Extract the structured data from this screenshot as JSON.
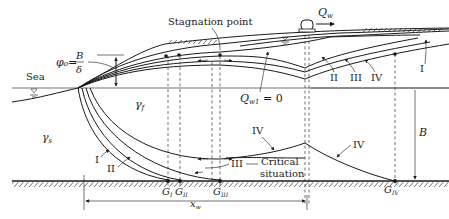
{
  "diagram": {
    "labels": {
      "sea": "Sea",
      "stagnation_point": "Stagnation point",
      "phi_formula_lhs": "φ₀=",
      "phi_numerator": "B",
      "phi_denominator": "δ",
      "q_w": "Q",
      "q_w_sub": "w",
      "q_w1": "Q",
      "q_w1_sub": "w1",
      "q_w1_eq": " = 0",
      "gamma_f": "γ",
      "gamma_f_sub": "f",
      "gamma_s": "γ",
      "gamma_s_sub": "s",
      "x_w": "x",
      "x_w_sub": "w",
      "b_dim": "B",
      "critical": "Critical",
      "situation": "situation",
      "I_top": "I",
      "II_top": "II",
      "III_top": "III",
      "IV_top": "IV",
      "I_bot": "I",
      "II_bot": "II",
      "III_bot": "III",
      "IV_bot_left": "IV",
      "IV_bot_right": "IV",
      "G": "G",
      "G_I_sub": "I",
      "G_II_sub": "II",
      "G_III_sub": "III",
      "G_IV_sub": "IV"
    }
  }
}
